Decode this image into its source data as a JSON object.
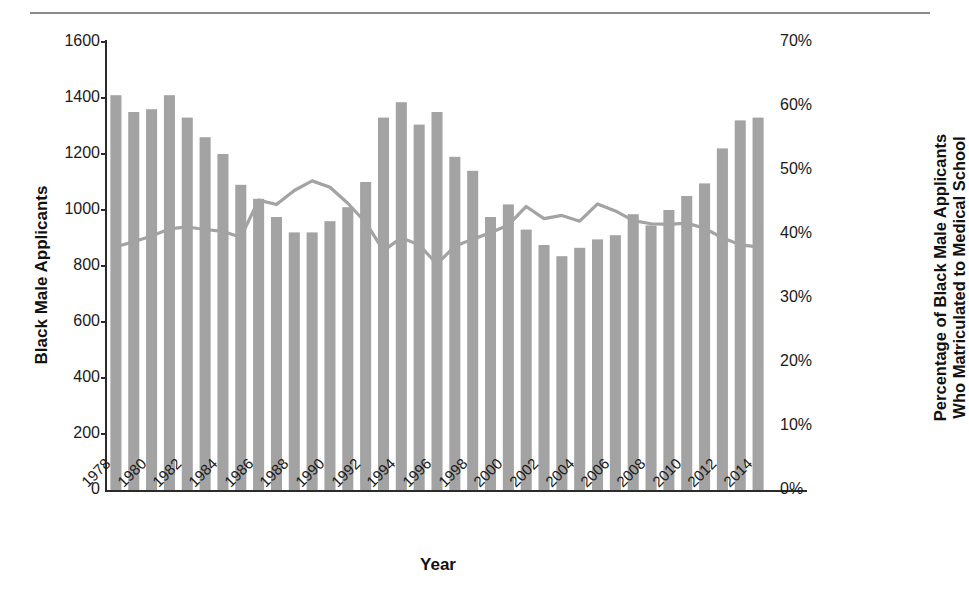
{
  "chart_data": {
    "type": "bar",
    "title": "",
    "xlabel": "Year",
    "ylabel": "Black Male Applicants",
    "ylabel_right": "Percentage of Black Male Applicants Who Matriculated to Medical School",
    "ylabel_right_line1": "Percentage of Black Male Applicants",
    "ylabel_right_line2": "Who Matriculated to Medical School",
    "grid": false,
    "legend": "none",
    "ylim": [
      0,
      1600
    ],
    "ylim_right": [
      0,
      70
    ],
    "yticks": [
      "0",
      "200",
      "400",
      "600",
      "800",
      "1000",
      "1200",
      "1400",
      "1600"
    ],
    "ytick_values": [
      0,
      200,
      400,
      600,
      800,
      1000,
      1200,
      1400,
      1600
    ],
    "yticks_right": [
      "0%",
      "10%",
      "20%",
      "30%",
      "40%",
      "50%",
      "60%",
      "70%"
    ],
    "ytick_values_right": [
      0,
      10,
      20,
      30,
      40,
      50,
      60,
      70
    ],
    "categories": [
      1978,
      1979,
      1980,
      1981,
      1982,
      1983,
      1984,
      1985,
      1986,
      1987,
      1988,
      1989,
      1990,
      1991,
      1992,
      1993,
      1994,
      1995,
      1996,
      1997,
      1998,
      1999,
      2000,
      2001,
      2002,
      2003,
      2004,
      2005,
      2006,
      2007,
      2008,
      2009,
      2010,
      2011,
      2012,
      2013,
      2014
    ],
    "xtick_labels": [
      "1978",
      "1980",
      "1982",
      "1984",
      "1986",
      "1988",
      "1990",
      "1992",
      "1994",
      "1996",
      "1998",
      "2000",
      "2002",
      "2004",
      "2006",
      "2008",
      "2010",
      "2012",
      "2014"
    ],
    "series": [
      {
        "name": "Black Male Applicants",
        "type": "bar",
        "axis": "left",
        "color": "#a3a3a3",
        "values": [
          1410,
          1350,
          1360,
          1410,
          1330,
          1260,
          1200,
          1090,
          1040,
          975,
          920,
          920,
          960,
          1010,
          1100,
          1330,
          1385,
          1305,
          1350,
          1190,
          1140,
          975,
          1020,
          930,
          875,
          835,
          865,
          895,
          910,
          985,
          945,
          1000,
          1050,
          1095,
          1220,
          1320,
          1330
        ]
      },
      {
        "name": "Percentage of Black Male Applicants Who Matriculated to Medical School",
        "type": "line",
        "axis": "right",
        "color": "#a3a3a3",
        "values": [
          38.0,
          38.8,
          39.7,
          40.8,
          41.1,
          40.7,
          40.4,
          39.5,
          45.3,
          44.6,
          46.8,
          48.3,
          47.3,
          44.8,
          41.8,
          37.4,
          39.4,
          38.3,
          35.3,
          38.1,
          39.2,
          40.2,
          41.4,
          44.3,
          42.4,
          42.9,
          42.0,
          44.7,
          43.6,
          42.1,
          41.6,
          41.5,
          41.7,
          40.9,
          39.4,
          38.3,
          38.0
        ]
      }
    ]
  },
  "figure": {
    "top_rule": "horizontal-rule"
  }
}
